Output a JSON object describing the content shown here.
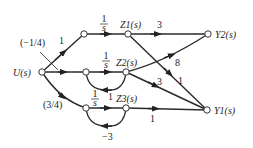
{
  "diagram": {
    "type": "signal-flow-graph",
    "nodes": {
      "u": "U(s)",
      "z1": "Z1(s)",
      "z2": "Z2(s)",
      "z3": "Z3(s)",
      "y1": "Y1(s)",
      "y2": "Y2(s)"
    },
    "gains": {
      "u_to_top": "1",
      "u_to_top_annotation": "(−1/4)",
      "u_to_bottom": "(3/4)",
      "top_integrator": "1/s",
      "mid_integrator": "1/s",
      "bottom_integrator": "1/s",
      "z2_feedback": "1",
      "z3_feedback": "−3",
      "z1_to_y2": "3",
      "z2_to_y2": "8",
      "z1_to_y1": "1",
      "z2_to_y1": "3",
      "z3_to_y1": "1"
    }
  }
}
